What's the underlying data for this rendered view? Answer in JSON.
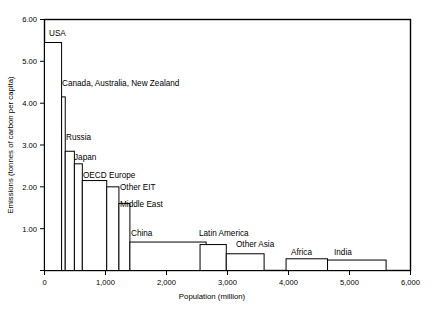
{
  "chart_data": {
    "type": "bar",
    "title": "",
    "subtitle": "",
    "xlabel": "Population (million)",
    "ylabel": "Emissions (tonnes of carbon per capita)",
    "xlim": [
      0,
      6000
    ],
    "ylim": [
      0,
      6.0
    ],
    "grid": false,
    "legend": "none",
    "note": "Variable-width bar chart: bar width = population (million), bar height = per-capita emissions (tonnes of carbon per capita). Bars are stacked left to right in descending emissions order.",
    "xticks": [
      0,
      1000,
      2000,
      3000,
      4000,
      5000,
      6000
    ],
    "xtick_labels": [
      "0",
      "1,000",
      "2,000",
      "3,000",
      "4,000",
      "5,000",
      "6,000"
    ],
    "yticks": [
      1.0,
      2.0,
      3.0,
      4.0,
      5.0,
      6.0
    ],
    "ytick_labels": [
      "1.00",
      "2.00",
      "3.00",
      "4.00",
      "5.00",
      "6.00"
    ],
    "categories": [
      "USA",
      "Canada, Australia, New Zealand",
      "Russia",
      "Japan",
      "OECD Europe",
      "Other EIT",
      "Middle East",
      "China",
      "Latin America",
      "Other Asia",
      "Africa",
      "India"
    ],
    "values": [
      5.45,
      4.15,
      2.85,
      2.55,
      2.15,
      2.0,
      1.6,
      0.68,
      0.62,
      0.4,
      0.28,
      0.25
    ],
    "widths": [
      280,
      60,
      150,
      130,
      400,
      200,
      180,
      1250,
      430,
      620,
      680,
      960
    ],
    "x_starts": [
      0,
      280,
      340,
      490,
      620,
      1020,
      1220,
      1400,
      2550,
      2980,
      3960,
      4640
    ],
    "x_ends": [
      280,
      340,
      490,
      620,
      1020,
      1220,
      1400,
      2650,
      2980,
      3600,
      4640,
      5600
    ],
    "series": [
      {
        "name": "Emissions (tonnes of carbon per capita)",
        "values": [
          5.45,
          4.15,
          2.85,
          2.55,
          2.15,
          2.0,
          1.6,
          0.68,
          0.62,
          0.4,
          0.28,
          0.25
        ]
      }
    ],
    "annotations": [
      {
        "text": "USA",
        "value": 5.45
      },
      {
        "text": "Canada, Australia, New Zealand",
        "value": 4.15
      },
      {
        "text": "Russia",
        "value": 2.85
      },
      {
        "text": "Japan",
        "value": 2.55
      },
      {
        "text": "OECD Europe",
        "value": 2.15
      },
      {
        "text": "Other EIT",
        "value": 2.0
      },
      {
        "text": "Middle East",
        "value": 1.6
      },
      {
        "text": "China",
        "value": 0.68
      },
      {
        "text": "Latin America",
        "value": 0.62
      },
      {
        "text": "Other Asia",
        "value": 0.4
      },
      {
        "text": "Africa",
        "value": 0.28
      },
      {
        "text": "India",
        "value": 0.25
      }
    ]
  },
  "labels": {
    "usa": "USA",
    "canada_aus_nz": "Canada, Australia, New Zealand",
    "russia": "Russia",
    "japan": "Japan",
    "oecd_europe": "OECD Europe",
    "other_eit": "Other EIT",
    "middle_east": "Middle East",
    "china": "China",
    "latin_america": "Latin America",
    "other_asia": "Other Asia",
    "africa": "Africa",
    "india": "India"
  },
  "axis": {
    "x_title": "Population (million)",
    "y_title": "Emissions (tonnes of carbon per capita)",
    "x_tick_0": "0",
    "x_tick_1": "1,000",
    "x_tick_2": "2,000",
    "x_tick_3": "3,000",
    "x_tick_4": "4,000",
    "x_tick_5": "5,000",
    "x_tick_6": "6,000",
    "y_tick_1": "1.00",
    "y_tick_2": "2.00",
    "y_tick_3": "3.00",
    "y_tick_4": "4.00",
    "y_tick_5": "5.00",
    "y_tick_6": "6.00"
  },
  "colors": {
    "background": "#ffffff",
    "frame": "#000000",
    "bar_fill": "#ffffff",
    "bar_stroke": "#000000",
    "text": "#000000"
  }
}
